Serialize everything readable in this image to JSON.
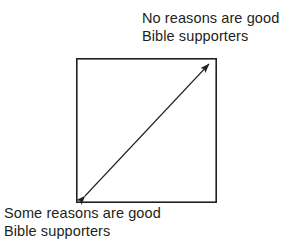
{
  "figure": {
    "name": "bible-supporters-continuum-diagram",
    "background_color": "#ffffff",
    "stroke_color": "#231f20",
    "text_color": "#231f20"
  },
  "labels": {
    "top": {
      "line1": "No reasons are good",
      "line2": "Bible supporters"
    },
    "bottom": {
      "line1": "Some reasons are good",
      "line2": "Bible supporters"
    }
  },
  "shapes": {
    "box": {
      "name": "bounding-square",
      "x": 76,
      "y": 58,
      "width": 141,
      "height": 145,
      "stroke_width": 1.6
    },
    "arrow": {
      "name": "double-headed-diagonal-arrow",
      "x1": 85,
      "y1": 196,
      "x2": 209,
      "y2": 64,
      "stroke_width": 1.1,
      "head_length": 13,
      "head_width": 7
    }
  }
}
